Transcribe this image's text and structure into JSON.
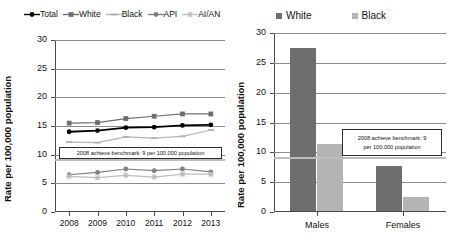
{
  "chart_data": [
    {
      "type": "line",
      "title": "",
      "xlabel": "",
      "ylabel": "Rate per 100,000 population",
      "x": [
        "2008",
        "2009",
        "2010",
        "2011",
        "2012",
        "2013"
      ],
      "ylim": [
        0,
        30
      ],
      "yticks": [
        0,
        5,
        10,
        15,
        20,
        25,
        30
      ],
      "grid": true,
      "legend_position": "top",
      "series": [
        {
          "name": "Total",
          "color": "#000000",
          "marker": "circle",
          "values": [
            14.0,
            14.2,
            14.7,
            14.8,
            15.1,
            15.2
          ]
        },
        {
          "name": "White",
          "color": "#6e6e6e",
          "marker": "square",
          "values": [
            15.5,
            15.6,
            16.3,
            16.7,
            17.1,
            17.1
          ]
        },
        {
          "name": "Black",
          "color": "#b4b4b4",
          "marker": "dash",
          "values": [
            12.2,
            12.1,
            13.1,
            12.9,
            13.2,
            14.3
          ]
        },
        {
          "name": "API",
          "color": "#7f7f7f",
          "marker": "circle",
          "values": [
            6.5,
            6.9,
            7.5,
            7.2,
            7.5,
            7.0
          ]
        },
        {
          "name": "AI/AN",
          "color": "#bdbdbd",
          "marker": "star",
          "values": [
            6.2,
            6.0,
            6.4,
            6.1,
            6.6,
            6.6
          ]
        }
      ],
      "annotations": [
        {
          "text": "2008 achieve benchmark: 9 per 100,000 population",
          "value": 9,
          "type": "reference-line-label"
        }
      ]
    },
    {
      "type": "bar",
      "title": "",
      "xlabel": "",
      "ylabel": "Rate per 100,000 population",
      "categories": [
        "Males",
        "Females"
      ],
      "ylim": [
        0,
        30
      ],
      "yticks": [
        0,
        5,
        10,
        15,
        20,
        25,
        30
      ],
      "grid": true,
      "legend_position": "top",
      "series": [
        {
          "name": "White",
          "color": "#6e6e6e",
          "values": [
            27.3,
            7.5
          ]
        },
        {
          "name": "Black",
          "color": "#b4b4b4",
          "values": [
            11.3,
            2.3
          ]
        }
      ],
      "annotations": [
        {
          "text_line1": "2008 achieve benchmark: 9",
          "text_line2": "per 100,000 population",
          "value": 9,
          "type": "reference-line-label"
        }
      ]
    }
  ],
  "left": {
    "ylabel": "Rate per 100,000 population",
    "legend": [
      {
        "label": "Total"
      },
      {
        "label": "White"
      },
      {
        "label": "Black"
      },
      {
        "label": "API"
      },
      {
        "label": "AI/AN"
      }
    ],
    "yticks": [
      "30",
      "25",
      "20",
      "15",
      "10",
      "5",
      "0"
    ],
    "xticks": [
      "2008",
      "2009",
      "2010",
      "2011",
      "2012",
      "2013"
    ],
    "benchmark_text": "2008 achieve benchmark: 9 per 100,000 population"
  },
  "right": {
    "ylabel": "Rate per 100,000 population",
    "legend": [
      {
        "label": "White"
      },
      {
        "label": "Black"
      }
    ],
    "yticks": [
      "30",
      "25",
      "20",
      "15",
      "10",
      "5",
      "0"
    ],
    "xticks": [
      "Males",
      "Females"
    ],
    "benchmark_line1": "2008 achieve benchmark: 9",
    "benchmark_line2": "per 100,000 population"
  }
}
